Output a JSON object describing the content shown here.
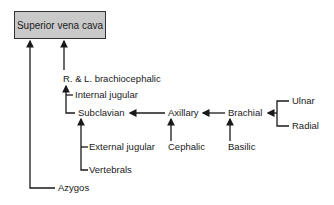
{
  "diagram": {
    "type": "venous drainage flow diagram",
    "root": "Superior vena cava",
    "nodes": {
      "svc": "Superior vena cava",
      "brachiocephalic": "R. & L. brachiocephalic",
      "internal_jugular": "Internal jugular",
      "subclavian": "Subclavian",
      "external_jugular": "External jugular",
      "vertebrals": "Vertebrals",
      "azygos": "Azygos",
      "axillary": "Axillary",
      "cephalic": "Cephalic",
      "brachial": "Brachial",
      "basilic": "Basilic",
      "ulnar": "Ulnar",
      "radial": "Radial"
    },
    "edges": [
      [
        "Azygos",
        "Superior vena cava"
      ],
      [
        "R. & L. brachiocephalic",
        "Superior vena cava"
      ],
      [
        "Internal jugular",
        "R. & L. brachiocephalic"
      ],
      [
        "Subclavian",
        "R. & L. brachiocephalic"
      ],
      [
        "External jugular",
        "Subclavian"
      ],
      [
        "Vertebrals",
        "Subclavian"
      ],
      [
        "Axillary",
        "Subclavian"
      ],
      [
        "Cephalic",
        "Axillary"
      ],
      [
        "Brachial",
        "Axillary"
      ],
      [
        "Basilic",
        "Brachial"
      ],
      [
        "Ulnar",
        "Brachial"
      ],
      [
        "Radial",
        "Brachial"
      ]
    ],
    "colors": {
      "box_fill": "#c9c9c9",
      "line": "#1a1a1a"
    }
  }
}
